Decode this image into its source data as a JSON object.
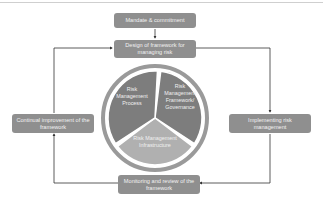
{
  "diagram": {
    "boxes": {
      "mandate": "Mandate & commitment",
      "design": "Design of framework for managing risk",
      "implementing": "Implementing risk management",
      "monitoring": "Monitoring and review of the framework",
      "continual": "Continual improvement of the framework"
    },
    "segments": {
      "process": [
        "Risk",
        "Management",
        "Process"
      ],
      "framework": [
        "Risk",
        "Management",
        "Framework/",
        "Governance"
      ],
      "infrastructure": [
        "Risk Management",
        "Infrastructure"
      ]
    },
    "colors": {
      "box": "#8f8f8f",
      "segment_dark": "#7d7d7d",
      "segment_light": "#b0b0b0",
      "ring": "#9a9a9a",
      "arrow": "#333333"
    }
  }
}
